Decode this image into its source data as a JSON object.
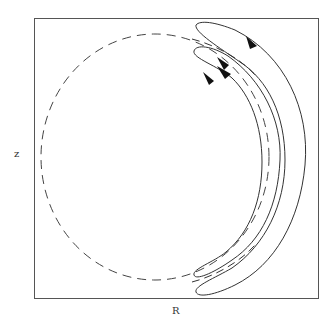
{
  "figure": {
    "type": "orbit-diagram",
    "axes": {
      "x_label": "R",
      "y_label": "z"
    },
    "colors": {
      "stroke": "#333333",
      "background": "#ffffff"
    },
    "elements": [
      {
        "name": "reference-circle",
        "style": "dashed"
      },
      {
        "name": "outer-orbit",
        "style": "solid",
        "arrows": 1
      },
      {
        "name": "inner-orbit",
        "style": "solid",
        "arrows": 2
      },
      {
        "name": "middle-orbit",
        "style": "solid",
        "arrows": 1
      }
    ]
  }
}
